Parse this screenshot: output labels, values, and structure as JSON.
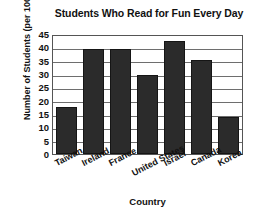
{
  "chart_data": {
    "type": "bar",
    "title": "Students Who Read for Fun Every Day",
    "xlabel": "Country",
    "ylabel": "Number of Students (per 100)",
    "categories": [
      "Taiwan",
      "Ireland",
      "France",
      "United States",
      "Israel",
      "Canada",
      "Korea"
    ],
    "values": [
      18,
      40,
      40,
      30,
      43,
      36,
      14
    ],
    "ylim": [
      0,
      45
    ],
    "yticks": [
      0,
      5,
      10,
      15,
      20,
      25,
      30,
      35,
      40,
      45
    ],
    "grid": true,
    "legend": false,
    "bar_color": "#2b2b2b"
  }
}
